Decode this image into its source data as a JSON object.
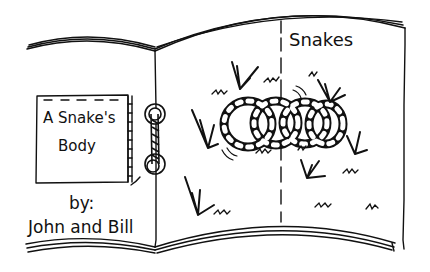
{
  "illustration": {
    "subject": "open hand-drawn book",
    "cover": {
      "title_line1": "A Snake's",
      "title_line2": "Body",
      "byline_label": "by:",
      "authors": "John and Bill"
    },
    "right_page": {
      "heading": "Snakes",
      "icons": [
        "snake-icon",
        "grass-icon",
        "book-ring-icon"
      ]
    },
    "colors": {
      "ink": "#111111",
      "paper": "#ffffff"
    }
  }
}
